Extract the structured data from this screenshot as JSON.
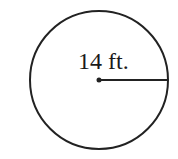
{
  "diagram": {
    "shape": "circle",
    "radius_label": "14 ft.",
    "stroke_color": "#222222",
    "background": "#ffffff"
  }
}
